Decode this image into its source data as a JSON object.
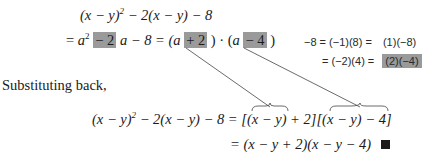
{
  "step1": {
    "lhs": "(x − y)",
    "exp": "2",
    "rest": " − 2(x − y) − 8"
  },
  "step2": {
    "eq": "= ",
    "a": "a",
    "exp": "2",
    "hl_coef": "− 2",
    "mid": "a − 8 = (",
    "a2": "a",
    "hl_plus": "+ 2",
    "close1": ") · (",
    "a3": "a",
    "hl_minus": "− 4",
    "close2": ")"
  },
  "factor_note": {
    "row1_left": "−8 = (−1)(8) =",
    "row1_right": "(1)(−8)",
    "row2_left": "= (−2)(4) =",
    "row2_right": "(2)(−4)"
  },
  "substituting": "Substituting back,",
  "step3": {
    "lhs": "(x − y)",
    "exp": "2",
    "rest": " − 2(x − y) − 8 = [",
    "grp1": "(x − y)",
    "mid": " + 2][",
    "grp2": "(x − y)",
    "end": " − 4]"
  },
  "step4": {
    "text": "= (x − y + 2)(x − y − 4)",
    "qed": "■"
  },
  "colors": {
    "highlight": "#9a9a9a",
    "ink": "#1a1a1a"
  }
}
